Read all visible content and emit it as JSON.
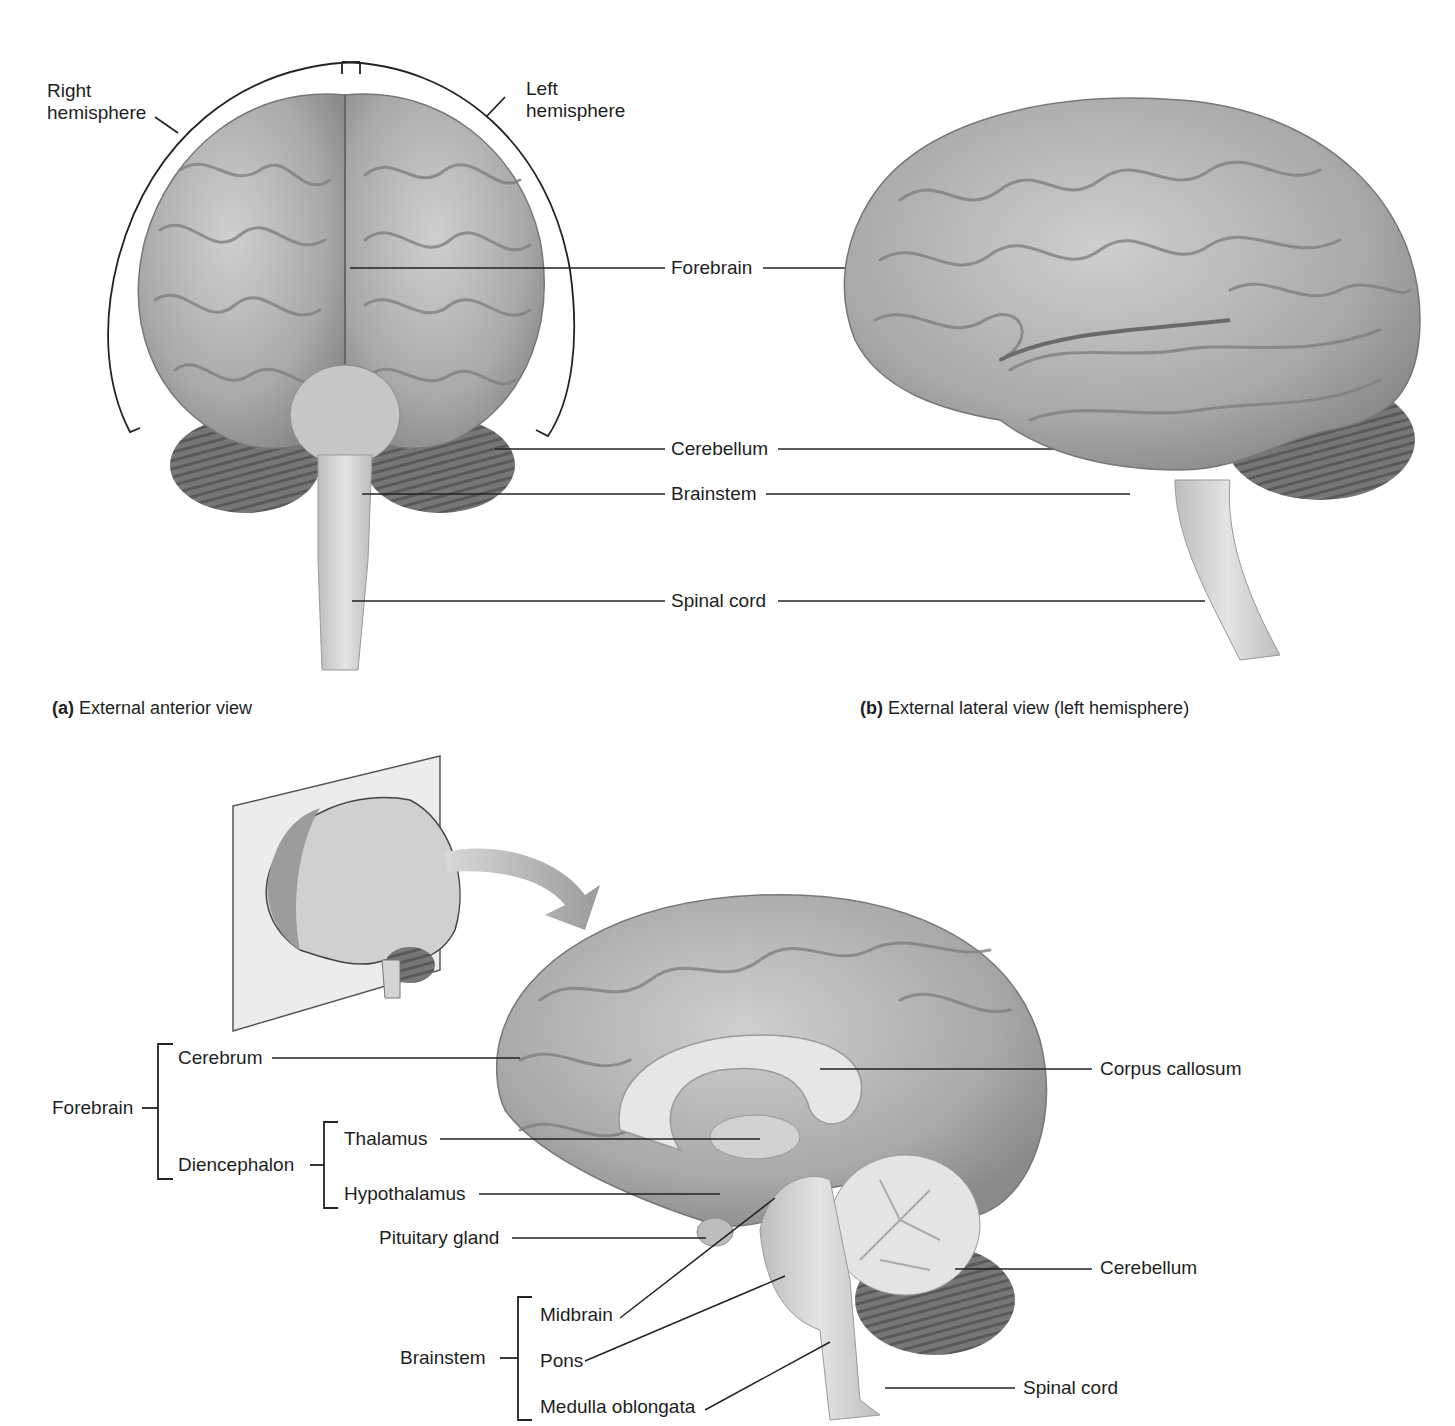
{
  "header": {
    "text": ""
  },
  "panel_a": {
    "caption_letter": "(a)",
    "caption_text": "External anterior view",
    "labels": {
      "right_hemisphere_1": "Right",
      "right_hemisphere_2": "hemisphere",
      "left_hemisphere_1": "Left",
      "left_hemisphere_2": "hemisphere"
    }
  },
  "panel_b": {
    "caption_letter": "(b)",
    "caption_text": "External lateral view (left hemisphere)"
  },
  "shared_labels": {
    "forebrain": "Forebrain",
    "cerebellum": "Cerebellum",
    "brainstem": "Brainstem",
    "spinal_cord": "Spinal cord"
  },
  "panel_c": {
    "groups": {
      "forebrain": "Forebrain",
      "diencephalon": "Diencephalon",
      "brainstem": "Brainstem"
    },
    "labels": {
      "cerebrum": "Cerebrum",
      "thalamus": "Thalamus",
      "hypothalamus": "Hypothalamus",
      "pituitary": "Pituitary gland",
      "midbrain": "Midbrain",
      "pons": "Pons",
      "medulla": "Medulla oblongata",
      "corpus_callosum": "Corpus callosum",
      "cerebellum": "Cerebellum",
      "spinal_cord": "Spinal cord"
    }
  }
}
